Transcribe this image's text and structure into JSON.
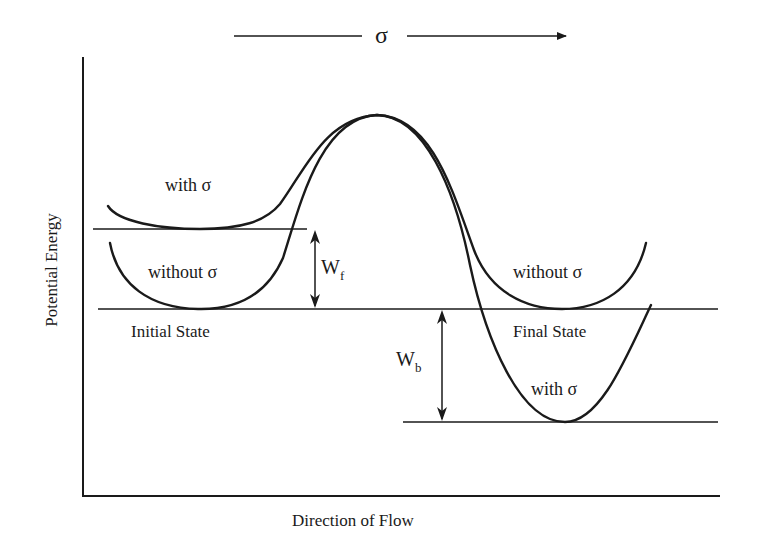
{
  "diagram": {
    "type": "potential-energy-diagram",
    "stress_arrow": {
      "label": "σ"
    },
    "axes": {
      "y_label": "Potential Energy",
      "x_label": "Direction of Flow"
    },
    "curves": [
      {
        "name": "with-stress",
        "label_left": "with  σ",
        "label_right": "with  σ"
      },
      {
        "name": "without-stress",
        "label_left": "without  σ",
        "label_right": "without  σ"
      }
    ],
    "states": {
      "initial": "Initial State",
      "final": "Final State"
    },
    "barriers": {
      "forward": {
        "main": "W",
        "sub": "f"
      },
      "backward": {
        "main": "W",
        "sub": "b"
      }
    },
    "colors": {
      "line": "#1a1a1a",
      "background": "#ffffff"
    }
  }
}
